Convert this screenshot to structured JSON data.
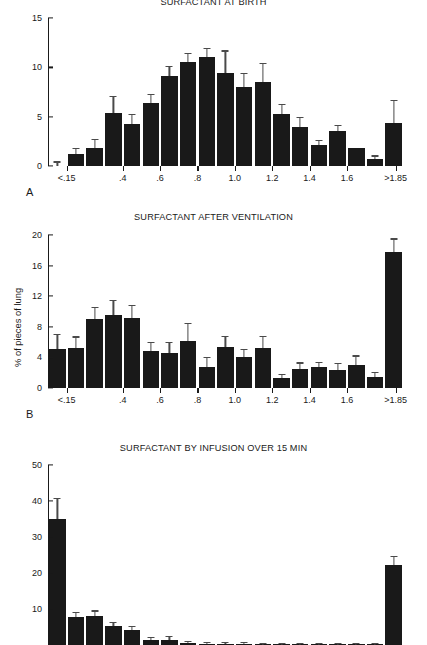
{
  "figure": {
    "y_axis_label": "% of pieces of lung",
    "panel_letters": [
      "A",
      "B",
      "C"
    ]
  },
  "chart_data": [
    {
      "type": "bar",
      "panel": "A",
      "title": "SURFACTANT AT BIRTH",
      "xlabel": "",
      "ylabel": "",
      "ylim": [
        0,
        15
      ],
      "yticks": [
        0,
        5,
        10,
        15
      ],
      "xtick_labels": [
        "<.15",
        ".4",
        ".6",
        ".8",
        "1.0",
        "1.2",
        "1.4",
        "1.6",
        ">1.85"
      ],
      "grid": false,
      "categories": [
        "<.15",
        "0.2",
        "0.3",
        "0.4",
        "0.5",
        "0.6",
        "0.7",
        "0.8",
        "0.9",
        "1.0",
        "1.1",
        "1.2",
        "1.3",
        "1.4",
        "1.5",
        "1.6",
        "1.7",
        "1.8",
        ">1.85"
      ],
      "values": [
        0.0,
        1.2,
        1.8,
        5.4,
        4.3,
        6.4,
        9.1,
        10.5,
        11.0,
        9.4,
        8.0,
        8.5,
        5.3,
        4.0,
        2.1,
        3.5,
        1.8,
        0.7,
        4.4
      ],
      "errors": [
        0.35,
        0.55,
        0.85,
        1.6,
        0.85,
        0.75,
        0.9,
        0.85,
        0.85,
        2.2,
        1.3,
        1.8,
        0.85,
        0.85,
        0.4,
        0.55,
        0.0,
        0.25,
        2.2
      ]
    },
    {
      "type": "bar",
      "panel": "B",
      "title": "SURFACTANT AFTER VENTILATION",
      "xlabel": "",
      "ylabel": "% of pieces of lung",
      "ylim": [
        0,
        20
      ],
      "yticks": [
        0,
        4,
        8,
        12,
        16,
        20
      ],
      "xtick_labels": [
        "<.15",
        ".4",
        ".6",
        ".8",
        "1.0",
        "1.2",
        "1.4",
        "1.6",
        ">1.85"
      ],
      "grid": false,
      "categories": [
        "<.15",
        "0.2",
        "0.3",
        "0.4",
        "0.5",
        "0.6",
        "0.7",
        "0.8",
        "0.9",
        "1.0",
        "1.1",
        "1.2",
        "1.3",
        "1.4",
        "1.5",
        "1.6",
        "1.7",
        "1.8",
        ">1.85"
      ],
      "values": [
        5.1,
        5.2,
        9.0,
        9.5,
        9.2,
        4.8,
        4.6,
        6.1,
        2.8,
        5.3,
        4.0,
        5.2,
        1.3,
        2.5,
        2.8,
        2.3,
        3.0,
        1.4,
        17.8
      ],
      "errors": [
        1.8,
        1.4,
        1.5,
        1.9,
        1.5,
        1.1,
        1.3,
        2.3,
        1.1,
        1.4,
        1.0,
        1.5,
        0.4,
        0.7,
        0.5,
        0.8,
        1.1,
        0.6,
        1.6
      ]
    },
    {
      "type": "bar",
      "panel": "C",
      "title": "SURFACTANT BY INFUSION OVER 15 MIN",
      "xlabel": "",
      "ylabel": "",
      "ylim": [
        0,
        50
      ],
      "yticks": [
        10,
        20,
        30,
        40,
        50
      ],
      "xtick_labels": [],
      "grid": false,
      "categories": [
        "<.15",
        "0.2",
        "0.3",
        "0.4",
        "0.5",
        "0.6",
        "0.7",
        "0.8",
        "0.9",
        "1.0",
        "1.1",
        "1.2",
        "1.3",
        "1.4",
        "1.5",
        "1.6",
        "1.7",
        "1.8",
        ">1.85"
      ],
      "values": [
        35.0,
        7.7,
        8.0,
        5.2,
        4.2,
        1.4,
        1.5,
        0.5,
        0.4,
        0.3,
        0.3,
        0.2,
        0.2,
        0.2,
        0.2,
        0.2,
        0.2,
        0.2,
        22.2
      ],
      "errors": [
        5.5,
        1.1,
        1.3,
        0.8,
        0.8,
        0.6,
        0.7,
        0.3,
        0.2,
        0.2,
        0.2,
        0.1,
        0.1,
        0.1,
        0.1,
        0.1,
        0.1,
        0.1,
        2.2
      ]
    }
  ]
}
